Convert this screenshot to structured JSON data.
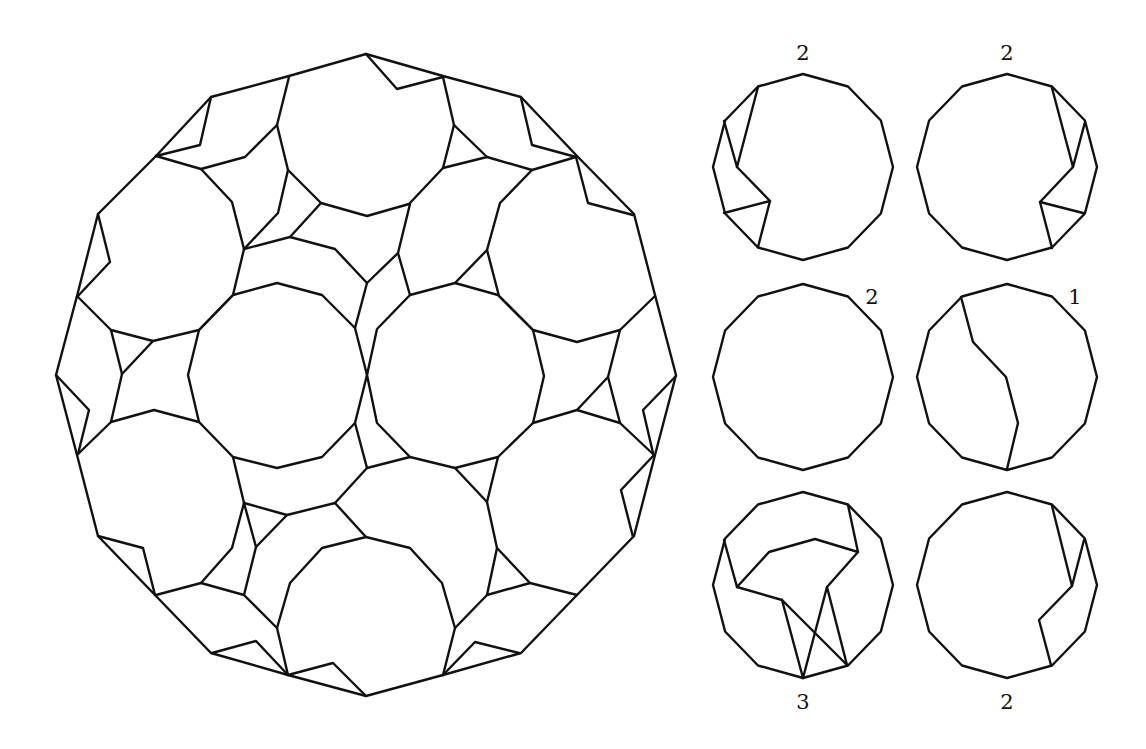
{
  "figure": {
    "stroke_color": "#111111",
    "background": "#ffffff"
  },
  "main_figure": {
    "name": "large-dodecagon-dissection",
    "polylines": [
      {
        "name": "outer-boundary",
        "closed": true,
        "points": [
          [
            366,
            54
          ],
          [
            443,
            76
          ],
          [
            521,
            97
          ],
          [
            577,
            156
          ],
          [
            634,
            214
          ],
          [
            655,
            295
          ],
          [
            676,
            375
          ],
          [
            655,
            455
          ],
          [
            634,
            536
          ],
          [
            577,
            595
          ],
          [
            521,
            653
          ],
          [
            443,
            675
          ],
          [
            366,
            696
          ],
          [
            288,
            675
          ],
          [
            211,
            653
          ],
          [
            155,
            595
          ],
          [
            98,
            536
          ],
          [
            77,
            455
          ],
          [
            56,
            375
          ],
          [
            77,
            296
          ],
          [
            98,
            214
          ],
          [
            156,
            156
          ],
          [
            211,
            97
          ],
          [
            289,
            76
          ]
        ]
      },
      {
        "name": "notch-top",
        "points": [
          [
            366,
            54
          ],
          [
            397,
            89
          ],
          [
            443,
            77
          ]
        ]
      },
      {
        "name": "notch-top-left",
        "points": [
          [
            211,
            97
          ],
          [
            200,
            145
          ],
          [
            156,
            156
          ]
        ]
      },
      {
        "name": "notch-left-upper",
        "points": [
          [
            98,
            214
          ],
          [
            110,
            262
          ],
          [
            77,
            297
          ]
        ]
      },
      {
        "name": "notch-left",
        "points": [
          [
            56,
            375
          ],
          [
            89,
            410
          ],
          [
            78,
            454
          ]
        ]
      },
      {
        "name": "notch-left-lower",
        "points": [
          [
            98,
            536
          ],
          [
            143,
            548
          ],
          [
            155,
            595
          ]
        ]
      },
      {
        "name": "notch-bottom-left",
        "points": [
          [
            212,
            653
          ],
          [
            256,
            641
          ],
          [
            288,
            675
          ]
        ]
      },
      {
        "name": "notch-bottom",
        "points": [
          [
            366,
            696
          ],
          [
            333,
            663
          ],
          [
            288,
            675
          ]
        ]
      },
      {
        "name": "notch-bottom-right",
        "points": [
          [
            519,
            653
          ],
          [
            475,
            642
          ],
          [
            443,
            675
          ]
        ]
      },
      {
        "name": "notch-right-lower",
        "points": [
          [
            633,
            537
          ],
          [
            621,
            490
          ],
          [
            654,
            455
          ]
        ]
      },
      {
        "name": "notch-right",
        "points": [
          [
            676,
            376
          ],
          [
            643,
            410
          ],
          [
            653,
            453
          ]
        ]
      },
      {
        "name": "notch-right-upper",
        "points": [
          [
            633,
            215
          ],
          [
            588,
            203
          ],
          [
            576,
            157
          ]
        ]
      },
      {
        "name": "notch-top-right",
        "points": [
          [
            521,
            98
          ],
          [
            532,
            145
          ],
          [
            576,
            157
          ]
        ]
      },
      {
        "name": "dodecagon-top",
        "points": [
          [
            289,
            77
          ],
          [
            277,
            125
          ],
          [
            288,
            170
          ],
          [
            321,
            203
          ],
          [
            367,
            216
          ],
          [
            409,
            204
          ],
          [
            443,
            168
          ],
          [
            454,
            125
          ],
          [
            443,
            77
          ]
        ]
      },
      {
        "name": "dodecagon-top-left",
        "points": [
          [
            156,
            156
          ],
          [
            201,
            169
          ],
          [
            232,
            202
          ],
          [
            244,
            249
          ],
          [
            233,
            295
          ],
          [
            199,
            330
          ],
          [
            153,
            341
          ],
          [
            111,
            330
          ],
          [
            78,
            297
          ]
        ]
      },
      {
        "name": "dodecagon-top-right",
        "points": [
          [
            576,
            157
          ],
          [
            532,
            170
          ],
          [
            500,
            203
          ],
          [
            487,
            250
          ],
          [
            499,
            296
          ],
          [
            533,
            330
          ],
          [
            577,
            342
          ],
          [
            620,
            330
          ],
          [
            655,
            296
          ]
        ]
      },
      {
        "name": "dodecagon-center-left",
        "closed": true,
        "points": [
          [
            277,
            283
          ],
          [
            322,
            295
          ],
          [
            355,
            328
          ],
          [
            367,
            375
          ],
          [
            355,
            423
          ],
          [
            322,
            457
          ],
          [
            277,
            468
          ],
          [
            233,
            457
          ],
          [
            199,
            422
          ],
          [
            188,
            375
          ],
          [
            199,
            330
          ],
          [
            233,
            295
          ]
        ]
      },
      {
        "name": "dodecagon-center-right",
        "closed": true,
        "points": [
          [
            455,
            283
          ],
          [
            498,
            295
          ],
          [
            533,
            330
          ],
          [
            544,
            376
          ],
          [
            533,
            423
          ],
          [
            498,
            457
          ],
          [
            455,
            468
          ],
          [
            410,
            457
          ],
          [
            377,
            423
          ],
          [
            367,
            375
          ],
          [
            377,
            329
          ],
          [
            410,
            295
          ]
        ]
      },
      {
        "name": "dodecagon-left-lower",
        "points": [
          [
            78,
            454
          ],
          [
            111,
            422
          ],
          [
            154,
            410
          ],
          [
            199,
            422
          ]
        ]
      },
      {
        "name": "dodecagon-left-lower-b",
        "points": [
          [
            233,
            457
          ],
          [
            244,
            503
          ],
          [
            232,
            548
          ],
          [
            201,
            583
          ],
          [
            156,
            595
          ]
        ]
      },
      {
        "name": "dodecagon-right-lower",
        "points": [
          [
            533,
            423
          ],
          [
            577,
            410
          ],
          [
            620,
            423
          ],
          [
            654,
            455
          ]
        ]
      },
      {
        "name": "dodecagon-right-lower-b",
        "points": [
          [
            498,
            457
          ],
          [
            487,
            502
          ],
          [
            497,
            548
          ],
          [
            530,
            583
          ],
          [
            577,
            595
          ]
        ]
      },
      {
        "name": "dodecagon-bottom",
        "points": [
          [
            288,
            675
          ],
          [
            277,
            628
          ],
          [
            290,
            583
          ],
          [
            322,
            548
          ],
          [
            366,
            537
          ],
          [
            410,
            548
          ],
          [
            442,
            583
          ],
          [
            455,
            628
          ],
          [
            443,
            675
          ]
        ]
      },
      {
        "name": "filler-top-left-a",
        "points": [
          [
            201,
            169
          ],
          [
            245,
            157
          ],
          [
            277,
            125
          ]
        ]
      },
      {
        "name": "filler-top-left-b",
        "points": [
          [
            288,
            170
          ],
          [
            278,
            213
          ],
          [
            244,
            249
          ]
        ]
      },
      {
        "name": "filler-top-left-c",
        "points": [
          [
            244,
            249
          ],
          [
            290,
            237
          ],
          [
            321,
            203
          ]
        ]
      },
      {
        "name": "filler-top-center",
        "points": [
          [
            290,
            237
          ],
          [
            335,
            249
          ],
          [
            367,
            283
          ],
          [
            398,
            253
          ],
          [
            410,
            204
          ]
        ]
      },
      {
        "name": "filler-top-center-b",
        "points": [
          [
            367,
            283
          ],
          [
            355,
            328
          ]
        ]
      },
      {
        "name": "filler-top-center-c",
        "points": [
          [
            398,
            253
          ],
          [
            410,
            295
          ]
        ]
      },
      {
        "name": "filler-top-right-a",
        "points": [
          [
            454,
            125
          ],
          [
            487,
            157
          ],
          [
            532,
            170
          ]
        ]
      },
      {
        "name": "filler-top-right-b",
        "points": [
          [
            487,
            157
          ],
          [
            443,
            168
          ]
        ]
      },
      {
        "name": "filler-top-right-c",
        "points": [
          [
            487,
            250
          ],
          [
            455,
            283
          ]
        ]
      },
      {
        "name": "filler-left-a",
        "points": [
          [
            111,
            330
          ],
          [
            122,
            374
          ],
          [
            111,
            422
          ]
        ]
      },
      {
        "name": "filler-left-b",
        "points": [
          [
            153,
            341
          ],
          [
            122,
            374
          ]
        ]
      },
      {
        "name": "filler-right-a",
        "points": [
          [
            620,
            330
          ],
          [
            608,
            377
          ],
          [
            620,
            423
          ]
        ]
      },
      {
        "name": "filler-right-b",
        "points": [
          [
            608,
            377
          ],
          [
            577,
            410
          ]
        ]
      },
      {
        "name": "filler-bottom-left-a",
        "points": [
          [
            244,
            503
          ],
          [
            287,
            515
          ],
          [
            335,
            503
          ],
          [
            366,
            537
          ]
        ]
      },
      {
        "name": "filler-bottom-left-b",
        "points": [
          [
            335,
            503
          ],
          [
            367,
            468
          ],
          [
            355,
            423
          ]
        ]
      },
      {
        "name": "filler-bottom-left-c",
        "points": [
          [
            244,
            503
          ],
          [
            256,
            547
          ],
          [
            287,
            515
          ]
        ]
      },
      {
        "name": "filler-bottom-left-d",
        "points": [
          [
            256,
            547
          ],
          [
            244,
            595
          ],
          [
            201,
            583
          ]
        ]
      },
      {
        "name": "filler-bottom-left-e",
        "points": [
          [
            244,
            595
          ],
          [
            277,
            628
          ]
        ]
      },
      {
        "name": "filler-bottom-center",
        "points": [
          [
            367,
            468
          ],
          [
            410,
            457
          ]
        ]
      },
      {
        "name": "filler-bottom-right-a",
        "points": [
          [
            455,
            468
          ],
          [
            487,
            502
          ]
        ]
      },
      {
        "name": "filler-bottom-right-b",
        "points": [
          [
            497,
            548
          ],
          [
            487,
            595
          ],
          [
            455,
            628
          ]
        ]
      },
      {
        "name": "filler-bottom-right-c",
        "points": [
          [
            530,
            583
          ],
          [
            487,
            595
          ]
        ]
      }
    ]
  },
  "small_figures": [
    {
      "name": "piece-top-left",
      "cx": 803,
      "cy": 167,
      "label": "2",
      "label_x": 803,
      "label_y": 60,
      "polylines": [
        [
          [
            758,
            87
          ],
          [
            737,
            167
          ],
          [
            724,
            121
          ]
        ],
        [
          [
            737,
            167
          ],
          [
            770,
            201
          ],
          [
            758,
            247
          ]
        ],
        [
          [
            724,
            213
          ],
          [
            770,
            201
          ]
        ]
      ]
    },
    {
      "name": "piece-top-right",
      "cx": 1007,
      "cy": 167,
      "label": "2",
      "label_x": 1007,
      "label_y": 60,
      "polylines": [
        [
          [
            1052,
            88
          ],
          [
            1073,
            167
          ],
          [
            1085,
            122
          ]
        ],
        [
          [
            1073,
            167
          ],
          [
            1040,
            202
          ],
          [
            1052,
            248
          ]
        ],
        [
          [
            1040,
            202
          ],
          [
            1083,
            213
          ]
        ]
      ]
    },
    {
      "name": "piece-middle-left",
      "cx": 803,
      "cy": 377,
      "label": "2",
      "label_x": 872,
      "label_y": 304,
      "polylines": []
    },
    {
      "name": "piece-middle-right",
      "cx": 1007,
      "cy": 377,
      "label": "1",
      "label_x": 1075,
      "label_y": 304,
      "polylines": [
        [
          [
            961,
            297
          ],
          [
            973,
            342
          ],
          [
            1006,
            377
          ],
          [
            1018,
            423
          ],
          [
            1007,
            469
          ]
        ]
      ]
    },
    {
      "name": "piece-bottom-left",
      "cx": 803,
      "cy": 585,
      "label": "3",
      "label_x": 803,
      "label_y": 709,
      "polylines": [
        [
          [
            724,
            540
          ],
          [
            737,
            587
          ],
          [
            769,
            552
          ],
          [
            815,
            539
          ],
          [
            858,
            552
          ],
          [
            848,
            505
          ]
        ],
        [
          [
            858,
            552
          ],
          [
            827,
            587
          ],
          [
            847,
            665
          ]
        ],
        [
          [
            827,
            587
          ],
          [
            803,
            678
          ]
        ],
        [
          [
            737,
            587
          ],
          [
            782,
            600
          ],
          [
            847,
            665
          ]
        ],
        [
          [
            782,
            600
          ],
          [
            803,
            678
          ]
        ]
      ]
    },
    {
      "name": "piece-bottom-right",
      "cx": 1007,
      "cy": 585,
      "label": "2",
      "label_x": 1007,
      "label_y": 709,
      "polylines": [
        [
          [
            1052,
            506
          ],
          [
            1072,
            586
          ],
          [
            1084,
            540
          ]
        ],
        [
          [
            1072,
            586
          ],
          [
            1039,
            620
          ],
          [
            1051,
            665
          ]
        ]
      ]
    }
  ],
  "small_dodecagon": {
    "rx": 90,
    "ry": 93,
    "sides": 12
  }
}
